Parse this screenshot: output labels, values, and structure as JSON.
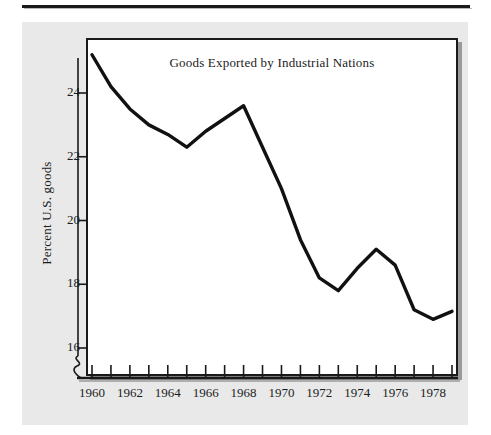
{
  "figure": {
    "background_color": "#e9e9e9",
    "plot_background_color": "#ffffff",
    "frame_color": "#1a1a1a",
    "line_color": "#111111",
    "text_color": "#1c1c1c"
  },
  "chart_data": {
    "type": "line",
    "title": "Goods Exported by Industrial Nations",
    "xlabel": "",
    "ylabel": "Percent U.S. goods",
    "xlim": [
      1960,
      1979
    ],
    "ylim": [
      15.3,
      25.6
    ],
    "y_ticks": [
      16,
      18,
      20,
      22,
      24
    ],
    "y_tick_labels": [
      "16",
      "18",
      "20",
      "22",
      "24"
    ],
    "x_ticks": [
      1960,
      1961,
      1962,
      1963,
      1964,
      1965,
      1966,
      1967,
      1968,
      1969,
      1970,
      1971,
      1972,
      1973,
      1974,
      1975,
      1976,
      1977,
      1978,
      1979
    ],
    "x_tick_labels_shown": [
      "1960",
      "1962",
      "1964",
      "1966",
      "1968",
      "1970",
      "1972",
      "1974",
      "1976",
      "1978"
    ],
    "x_labeled_ticks": [
      1960,
      1962,
      1964,
      1966,
      1968,
      1970,
      1972,
      1974,
      1976,
      1978
    ],
    "grid": false,
    "legend": false,
    "axis_break": true,
    "axis_break_note": "y-axis broken between 0 and 16",
    "x": [
      1960,
      1961,
      1962,
      1963,
      1964,
      1965,
      1966,
      1967,
      1968,
      1969,
      1970,
      1971,
      1972,
      1973,
      1974,
      1975,
      1976,
      1977,
      1978,
      1979
    ],
    "values": [
      25.2,
      24.2,
      23.5,
      23.0,
      22.7,
      22.3,
      22.8,
      23.2,
      23.6,
      22.3,
      21.0,
      19.4,
      18.2,
      17.8,
      18.5,
      19.1,
      18.6,
      17.2,
      16.9,
      17.15
    ],
    "series": [
      {
        "name": "Percent U.S. goods",
        "values": [
          25.2,
          24.2,
          23.5,
          23.0,
          22.7,
          22.3,
          22.8,
          23.2,
          23.6,
          22.3,
          21.0,
          19.4,
          18.2,
          17.8,
          18.5,
          19.1,
          18.6,
          17.2,
          16.9,
          17.15
        ]
      }
    ]
  }
}
